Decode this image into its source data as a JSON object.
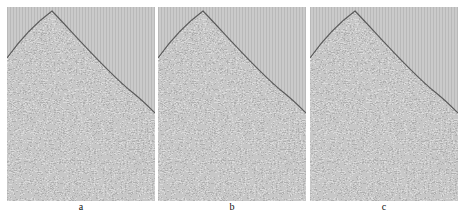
{
  "figure": {
    "type": "seismic-shot-gather-comparison",
    "colors": {
      "background_above_first_break": "#c9c9c9",
      "trace_line": "#b5b5b5",
      "data_fill": "#8a8a8a",
      "page": "#ffffff"
    },
    "panels": [
      {
        "id": "a",
        "label": "a",
        "left": 7
      },
      {
        "id": "b",
        "label": "b",
        "left": 158
      },
      {
        "id": "c",
        "label": "c",
        "left": 310
      }
    ]
  }
}
